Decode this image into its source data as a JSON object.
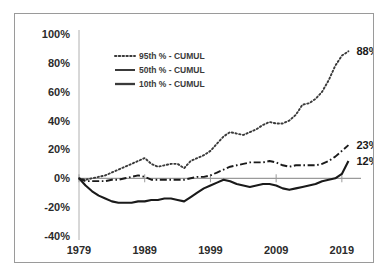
{
  "chart_data": {
    "type": "line",
    "title": "",
    "subtitle": "",
    "xlabel": "",
    "ylabel": "",
    "xlim": [
      1979,
      2021
    ],
    "ylim": [
      -40,
      100
    ],
    "ytick_labels": [
      "100%",
      "80%",
      "60%",
      "40%",
      "20%",
      "0%",
      "-20%",
      "-40%"
    ],
    "ytick_values": [
      100,
      80,
      60,
      40,
      20,
      0,
      -20,
      -40
    ],
    "xtick_labels": [
      "1979",
      "1989",
      "1999",
      "2009",
      "2019"
    ],
    "xtick_values": [
      1979,
      1989,
      1999,
      2009,
      2019
    ],
    "grid": false,
    "zero_line": true,
    "legend_position": "upper-left-inside",
    "legend": [
      {
        "label": "95th % - CUMUL",
        "style": "dotted"
      },
      {
        "label": "50th % - CUMUL",
        "style": "dash-dot"
      },
      {
        "label": "10th % - CUMUL",
        "style": "solid"
      }
    ],
    "annotations": [
      {
        "text": "88%",
        "series": "95th % - CUMUL",
        "x": 2020,
        "y": 88
      },
      {
        "text": "23%",
        "series": "50th % - CUMUL",
        "x": 2020,
        "y": 23
      },
      {
        "text": "12%",
        "series": "10th % - CUMUL",
        "x": 2020,
        "y": 12
      }
    ],
    "x": [
      1979,
      1980,
      1981,
      1982,
      1983,
      1984,
      1985,
      1986,
      1987,
      1988,
      1989,
      1990,
      1991,
      1992,
      1993,
      1994,
      1995,
      1996,
      1997,
      1998,
      1999,
      2000,
      2001,
      2002,
      2003,
      2004,
      2005,
      2006,
      2007,
      2008,
      2009,
      2010,
      2011,
      2012,
      2013,
      2014,
      2015,
      2016,
      2017,
      2018,
      2019,
      2020
    ],
    "series": [
      {
        "name": "95th % - CUMUL",
        "style": "dotted",
        "color": "#3a3a3a",
        "values": [
          0,
          -1,
          0,
          1,
          2,
          4,
          6,
          8,
          10,
          12,
          14,
          10,
          8,
          9,
          10,
          10,
          7,
          12,
          14,
          16,
          19,
          24,
          29,
          32,
          31,
          30,
          32,
          34,
          37,
          39,
          38,
          38,
          40,
          44,
          51,
          52,
          55,
          60,
          68,
          78,
          85,
          88
        ]
      },
      {
        "name": "50th % - CUMUL",
        "style": "dash-dot",
        "color": "#1a1a1a",
        "values": [
          0,
          -2,
          -2,
          -2,
          -2,
          -1,
          -1,
          0,
          1,
          2,
          1,
          -1,
          -1,
          -1,
          -1,
          -1,
          -1,
          0,
          1,
          1,
          2,
          4,
          6,
          8,
          9,
          10,
          11,
          11,
          11,
          12,
          11,
          9,
          8,
          9,
          9,
          9,
          9,
          10,
          12,
          15,
          19,
          23
        ]
      },
      {
        "name": "10th % - CUMUL",
        "style": "solid",
        "color": "#1a1a1a",
        "values": [
          0,
          -5,
          -9,
          -12,
          -14,
          -16,
          -17,
          -17,
          -17,
          -16,
          -16,
          -15,
          -15,
          -14,
          -14,
          -15,
          -16,
          -13,
          -10,
          -7,
          -5,
          -3,
          -1,
          -2,
          -4,
          -5,
          -6,
          -5,
          -4,
          -4,
          -5,
          -7,
          -8,
          -7,
          -6,
          -5,
          -4,
          -2,
          -1,
          0,
          3,
          12
        ]
      }
    ]
  }
}
